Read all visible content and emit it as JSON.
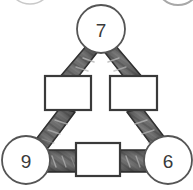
{
  "diagram": {
    "background_color": "#ffffff",
    "nodes": [
      {
        "id": "top",
        "name": "circle-node-top",
        "value": "7",
        "cx": 101,
        "cy": 29,
        "r": 24
      },
      {
        "id": "bottom-left",
        "name": "circle-node-bottom-left",
        "value": "9",
        "cx": 26,
        "cy": 160,
        "r": 24
      },
      {
        "id": "bottom-right",
        "name": "circle-node-bottom-right",
        "value": "6",
        "cx": 168,
        "cy": 160,
        "r": 24
      }
    ],
    "boxes": [
      {
        "id": "left",
        "name": "answer-box-left",
        "value": "",
        "x": 45,
        "y": 76,
        "w": 46,
        "h": 34
      },
      {
        "id": "right",
        "name": "answer-box-right",
        "value": "",
        "x": 110,
        "y": 76,
        "w": 47,
        "h": 34
      },
      {
        "id": "bottom",
        "name": "answer-box-bottom",
        "value": "",
        "x": 76,
        "y": 143,
        "w": 44,
        "h": 33
      }
    ],
    "connectors": [
      {
        "id": "top-left-upper",
        "name": "connector-band-top-to-left-box"
      },
      {
        "id": "top-right-upper",
        "name": "connector-band-top-to-right-box"
      },
      {
        "id": "left-box-lower",
        "name": "connector-band-left-box-to-bottom-left"
      },
      {
        "id": "right-box-lower",
        "name": "connector-band-right-box-to-bottom-right"
      },
      {
        "id": "bottom-left-strap",
        "name": "connector-band-bottom-left-to-bottom-box"
      },
      {
        "id": "bottom-right-strap",
        "name": "connector-band-bottom-box-to-bottom-right"
      }
    ],
    "partial_circles": [
      {
        "id": "top-left-cropped",
        "name": "cropped-circle-top-left",
        "cx": 30,
        "cy": -18,
        "r": 22
      },
      {
        "id": "top-right-cropped",
        "name": "cropped-circle-top-right",
        "cx": 178,
        "cy": -17,
        "r": 22
      }
    ],
    "colors": {
      "band_fill": "#6d6d6d",
      "band_fill_dark": "#4e4e4e",
      "band_stroke": "#2b2b2b",
      "band_highlight": "#9e9e9e",
      "circle_stroke": "#555555",
      "circle_fill": "#ffffff",
      "box_stroke": "#3a3a3a",
      "box_fill": "#ffffff",
      "text_color": "#3a3a3a",
      "faint_stroke": "#c9c9c9"
    }
  }
}
